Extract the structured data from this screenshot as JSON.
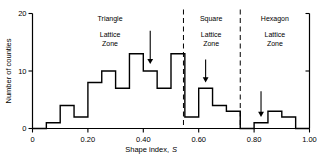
{
  "chart_data": {
    "type": "bar",
    "title": "",
    "xlabel": "Shape index, S",
    "xlabel_main": "Shape index,",
    "xlabel_italic": "S",
    "ylabel": "Number of counties",
    "xlim": [
      0.0,
      1.0
    ],
    "ylim": [
      0,
      20
    ],
    "grid": false,
    "legend": null,
    "bin_width": 0.05,
    "bin_edges": [
      0.0,
      0.05,
      0.1,
      0.15,
      0.2,
      0.25,
      0.3,
      0.35,
      0.4,
      0.45,
      0.5,
      0.55,
      0.6,
      0.65,
      0.7,
      0.75,
      0.8,
      0.85,
      0.9,
      0.95,
      1.0
    ],
    "categories": [
      "0.00-0.05",
      "0.05-0.10",
      "0.10-0.15",
      "0.15-0.20",
      "0.20-0.25",
      "0.25-0.30",
      "0.30-0.35",
      "0.35-0.40",
      "0.40-0.45",
      "0.45-0.50",
      "0.50-0.55",
      "0.55-0.60",
      "0.60-0.65",
      "0.65-0.70",
      "0.70-0.75",
      "0.75-0.80",
      "0.80-0.85",
      "0.85-0.90",
      "0.90-0.95",
      "0.95-1.00"
    ],
    "values": [
      0,
      1,
      4,
      2,
      8,
      10,
      7,
      13,
      10,
      7,
      13,
      2,
      7,
      4,
      3,
      0,
      1,
      3,
      2,
      0
    ],
    "xticks": [
      0.0,
      0.2,
      0.4,
      0.6,
      0.8,
      1.0
    ],
    "xtick_labels": [
      "0",
      "0.20",
      "0.40",
      "0.60",
      "0.80",
      "1.00"
    ],
    "yticks": [
      0,
      10,
      20
    ],
    "ytick_labels": [
      "0",
      "10",
      "20"
    ],
    "line_color": "#000000",
    "fill_color": "none",
    "annotations": {
      "dividers": [
        {
          "x": 0.545,
          "style": "dashed"
        },
        {
          "x": 0.75,
          "style": "dashed"
        }
      ],
      "arrows": [
        {
          "x": 0.425,
          "y_top": 17.0,
          "y_tip": 11.2,
          "label": ""
        },
        {
          "x": 0.625,
          "y_top": 12.0,
          "y_tip": 8.0,
          "label": ""
        },
        {
          "x": 0.825,
          "y_top": 6.5,
          "y_tip": 2.0,
          "label": ""
        }
      ],
      "zones": [
        {
          "name": "Triangle",
          "line1": "Triangle",
          "line2": "Lattice",
          "line3": "Zone",
          "x_center": 0.28
        },
        {
          "name": "Square",
          "line1": "Square",
          "line2": "Lattice",
          "line3": "Zone",
          "x_center": 0.645
        },
        {
          "name": "Hexagon",
          "line1": "Hexagon",
          "line2": "Lattice",
          "line3": "Zone",
          "x_center": 0.875
        }
      ]
    }
  }
}
